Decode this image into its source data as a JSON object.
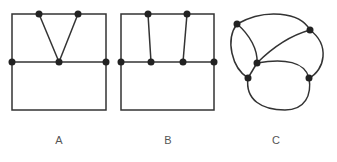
{
  "figures": [
    {
      "label": "A",
      "description": "Rectangle split horizontally; two top vertices joined to a single midline vertex (V shape)"
    },
    {
      "label": "B",
      "description": "Rectangle split horizontally; two top vertices joined by parallel-ish edges to two midline vertices"
    },
    {
      "label": "C",
      "description": "Curved planar graph with six vertices"
    }
  ],
  "colors": {
    "stroke": "#333333",
    "node": "#222222",
    "label": "#555555"
  }
}
